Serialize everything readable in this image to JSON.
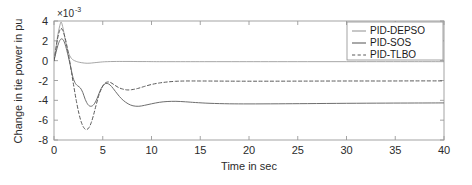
{
  "figure": {
    "background": "#ffffff",
    "axes_color": "#9a9a9a"
  },
  "chart_data": {
    "type": "line",
    "title": "",
    "xlabel": "Time in sec",
    "ylabel": "Change in tie power in pu",
    "y_exponent_base": "×10",
    "y_exponent_power": "-3",
    "y_multiplier": 0.001,
    "xlim": [
      0,
      40
    ],
    "ylim": [
      -8,
      4
    ],
    "xticks": [
      0,
      5,
      10,
      15,
      20,
      25,
      30,
      35,
      40
    ],
    "xticklabels": [
      "0",
      "5",
      "10",
      "15",
      "20",
      "25",
      "30",
      "35",
      "40"
    ],
    "yticks": [
      -8,
      -6,
      -4,
      -2,
      0,
      2,
      4
    ],
    "yticklabels": [
      "-8",
      "-6",
      "-4",
      "-2",
      "0",
      "2",
      "4"
    ],
    "grid": false,
    "legend_position": "top-right",
    "series": [
      {
        "name": "PID-DEPSO",
        "color": "#8f8f8f",
        "style": "solid",
        "width": 0.8,
        "x": [
          0,
          0.15,
          0.3,
          0.45,
          0.6,
          0.72,
          0.85,
          1.0,
          1.15,
          1.3,
          1.5,
          1.7,
          1.9,
          2.1,
          2.3,
          2.5,
          2.8,
          3.1,
          3.4,
          3.7,
          4.0,
          4.4,
          4.8,
          5.2,
          5.8,
          6.4,
          7.0,
          7.8,
          8.6,
          9.5,
          10.5,
          12.0,
          14.0,
          16.0,
          19.0,
          22.0,
          26.0,
          30.0,
          34.0,
          37.0,
          40.0
        ],
        "y": [
          0.0,
          0.9,
          2.0,
          2.9,
          3.55,
          3.9,
          3.6,
          2.9,
          2.1,
          1.45,
          0.75,
          0.35,
          0.12,
          0.0,
          -0.08,
          -0.14,
          -0.2,
          -0.24,
          -0.26,
          -0.25,
          -0.22,
          -0.18,
          -0.14,
          -0.11,
          -0.09,
          -0.08,
          -0.08,
          -0.08,
          -0.09,
          -0.09,
          -0.1,
          -0.1,
          -0.1,
          -0.1,
          -0.1,
          -0.1,
          -0.1,
          -0.1,
          -0.1,
          -0.1,
          -0.1
        ]
      },
      {
        "name": "PID-SOS",
        "color": "#6e6e6e",
        "style": "solid",
        "width": 1.0,
        "x": [
          0,
          0.2,
          0.4,
          0.6,
          0.8,
          1.0,
          1.2,
          1.45,
          1.7,
          1.95,
          2.2,
          2.45,
          2.7,
          2.95,
          3.2,
          3.5,
          3.8,
          4.1,
          4.4,
          4.7,
          5.0,
          5.3,
          5.6,
          5.9,
          6.3,
          6.7,
          7.1,
          7.6,
          8.1,
          8.7,
          9.3,
          10.0,
          10.8,
          11.6,
          12.5,
          13.5,
          14.5,
          16.0,
          18.0,
          20.0,
          23.0,
          26.0,
          30.0,
          34.0,
          37.0,
          40.0
        ],
        "y": [
          0.0,
          0.8,
          1.55,
          2.05,
          2.2,
          2.0,
          1.45,
          0.5,
          -0.6,
          -1.7,
          -2.3,
          -2.55,
          -2.75,
          -3.2,
          -3.9,
          -4.45,
          -4.6,
          -4.4,
          -3.85,
          -3.1,
          -2.55,
          -2.3,
          -2.35,
          -2.6,
          -3.1,
          -3.6,
          -4.0,
          -4.35,
          -4.55,
          -4.6,
          -4.5,
          -4.35,
          -4.2,
          -4.12,
          -4.1,
          -4.15,
          -4.22,
          -4.3,
          -4.35,
          -4.36,
          -4.35,
          -4.33,
          -4.3,
          -4.28,
          -4.27,
          -4.26
        ]
      },
      {
        "name": "PID-TLBO",
        "color": "#5a5a5a",
        "style": "dashed",
        "width": 1.0,
        "x": [
          0,
          0.18,
          0.36,
          0.55,
          0.72,
          0.9,
          1.1,
          1.3,
          1.55,
          1.8,
          2.05,
          2.3,
          2.55,
          2.8,
          3.05,
          3.3,
          3.55,
          3.8,
          4.05,
          4.3,
          4.6,
          4.9,
          5.2,
          5.5,
          5.8,
          6.2,
          6.6,
          7.0,
          7.5,
          8.0,
          8.6,
          9.2,
          10.0,
          10.8,
          11.6,
          12.5,
          13.5,
          15.0,
          17.0,
          19.0,
          22.0,
          26.0,
          30.0,
          34.0,
          37.0,
          40.0
        ],
        "y": [
          0.0,
          1.1,
          2.2,
          2.95,
          3.25,
          3.05,
          2.45,
          1.6,
          0.3,
          -1.2,
          -2.7,
          -4.1,
          -5.3,
          -6.2,
          -6.75,
          -6.95,
          -6.8,
          -6.3,
          -5.5,
          -4.55,
          -3.5,
          -2.75,
          -2.3,
          -2.15,
          -2.2,
          -2.45,
          -2.7,
          -2.85,
          -2.95,
          -2.92,
          -2.8,
          -2.62,
          -2.4,
          -2.25,
          -2.15,
          -2.08,
          -2.05,
          -2.05,
          -2.06,
          -2.07,
          -2.07,
          -2.06,
          -2.05,
          -2.05,
          -2.04,
          -2.04
        ]
      }
    ]
  },
  "legend": {
    "entries": [
      {
        "label": "PID-DEPSO"
      },
      {
        "label": "PID-SOS"
      },
      {
        "label": "PID-TLBO"
      }
    ]
  }
}
